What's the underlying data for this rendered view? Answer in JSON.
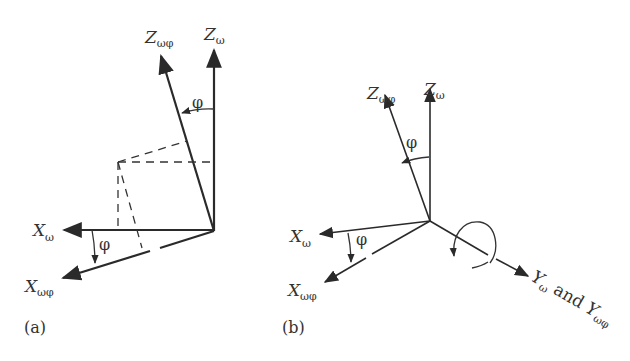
{
  "figure": {
    "panel_a": {
      "label": "(a)",
      "axes": {
        "z_rot": {
          "main": "Z",
          "sub": "ωφ"
        },
        "z": {
          "main": "Z",
          "sub": "ω"
        },
        "x": {
          "main": "X",
          "sub": "ω"
        },
        "x_rot": {
          "main": "X",
          "sub": "ωφ"
        }
      },
      "angle_top": "φ",
      "angle_bottom": "φ"
    },
    "panel_b": {
      "label": "(b)",
      "axes": {
        "z_rot": {
          "main": "Z",
          "sub": "ωφ"
        },
        "z": {
          "main": "Z",
          "sub": "ω"
        },
        "x": {
          "main": "X",
          "sub": "ω"
        },
        "x_rot": {
          "main": "X",
          "sub": "ωφ"
        },
        "y": {
          "main1": "Y",
          "sub1": "ω",
          "connector": " and ",
          "main2": "Y",
          "sub2": "ωφ"
        }
      },
      "angle_top": "φ",
      "angle_bottom": "φ",
      "rotation_indicator": "rotation-about-y-axis"
    },
    "colors": {
      "ink": "#2a2a2a",
      "background": "#ffffff"
    }
  }
}
